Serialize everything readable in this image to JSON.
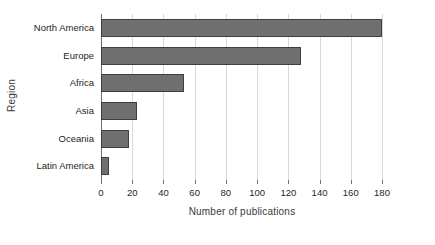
{
  "chart_data": {
    "type": "bar",
    "orientation": "horizontal",
    "title": "",
    "xlabel": "Number of publications",
    "ylabel": "Region",
    "categories": [
      "North America",
      "Europe",
      "Africa",
      "Asia",
      "Oceania",
      "Latin America"
    ],
    "values": [
      180,
      128,
      53,
      23,
      18,
      5
    ],
    "xlim": [
      0,
      180
    ],
    "xticks": [
      0,
      20,
      40,
      60,
      80,
      100,
      120,
      140,
      160,
      180
    ],
    "xtick_labels": [
      "0",
      "20",
      "40",
      "60",
      "80",
      "100",
      "120",
      "140",
      "160",
      "180"
    ],
    "grid": true,
    "grid_axis": "x",
    "legend": "none",
    "bar_color": "#6f6f6f",
    "bar_edge_color": "#3f3f3f",
    "grid_color": "#d9d9d9",
    "axis_color": "#6e6e6e",
    "background_color": "#ffffff"
  }
}
